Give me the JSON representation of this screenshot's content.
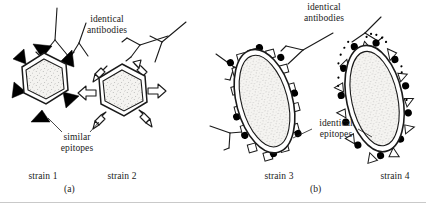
{
  "figure": {
    "title_caption": "",
    "panels": [
      {
        "id": "(a)",
        "antibody_label": "identical\nantibodies",
        "antibody_label_line1": "identical",
        "antibody_label_line2": "antibodies",
        "epitope_label_line1": "similar",
        "epitope_label_line2": "epitopes",
        "strains": [
          {
            "name": "strain 1",
            "epitope_style": "filled-black-triangle",
            "body_shape": "hexagon"
          },
          {
            "name": "strain 2",
            "epitope_style": "open-outline-arrow",
            "body_shape": "hexagon"
          }
        ]
      },
      {
        "id": "(b)",
        "antibody_label_line1": "identical",
        "antibody_label_line2": "antibodies",
        "epitope_label_line1": "identical",
        "epitope_label_line2": "epitopes",
        "strains": [
          {
            "name": "strain 3",
            "epitope_style": "open-square",
            "body_shape": "ellipse-rod"
          },
          {
            "name": "strain 4",
            "epitope_style": "open-triangle",
            "body_shape": "ellipse-rod"
          }
        ]
      }
    ],
    "shared_epitope_marker": "filled-black-circle",
    "colors": {
      "ink": "#1a1a1a",
      "background": "#ffffff",
      "epitope_fill_dark": "#000000",
      "capsid_fill": "#f2f1ee",
      "divider": "#c9c9c9"
    }
  }
}
